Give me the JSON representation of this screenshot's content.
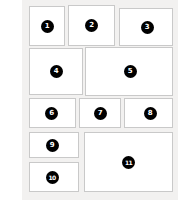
{
  "diagram": {
    "canvas": {
      "background_color": "#ffffff",
      "field_color": "#f2f1f0",
      "panel_fill": "#ffffff",
      "panel_border_color": "#c9c9c9",
      "badge_fill": "#000000",
      "badge_text_color": "#ffffff"
    },
    "panels": [
      {
        "id": "panel-1",
        "label": "1",
        "row": 1,
        "column": 1
      },
      {
        "id": "panel-2",
        "label": "2",
        "row": 1,
        "column": 2
      },
      {
        "id": "panel-3",
        "label": "3",
        "row": 1,
        "column": 3
      },
      {
        "id": "panel-4",
        "label": "4",
        "row": 2,
        "column": 1
      },
      {
        "id": "panel-5",
        "label": "5",
        "row": 2,
        "column": 2
      },
      {
        "id": "panel-6",
        "label": "6",
        "row": 3,
        "column": 1
      },
      {
        "id": "panel-7",
        "label": "7",
        "row": 3,
        "column": 2
      },
      {
        "id": "panel-8",
        "label": "8",
        "row": 3,
        "column": 3
      },
      {
        "id": "panel-9",
        "label": "9",
        "row": 4,
        "column": 1
      },
      {
        "id": "panel-10",
        "label": "10",
        "row": 5,
        "column": 1
      },
      {
        "id": "panel-11",
        "label": "11",
        "row": 4,
        "column": 2
      }
    ]
  }
}
